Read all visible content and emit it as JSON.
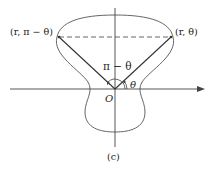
{
  "figure": {
    "caption": "(c)",
    "labels": {
      "point_left": "(r, π − θ)",
      "point_right": "(r, θ)",
      "angle_left": "π − θ",
      "angle_right": "θ",
      "origin": "O"
    },
    "colors": {
      "stroke": "#444444",
      "text": "#222222",
      "background": "#ffffff"
    }
  }
}
